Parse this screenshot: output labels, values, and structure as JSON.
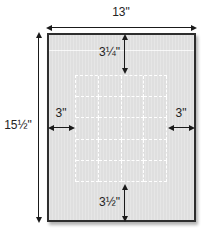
{
  "diagram": {
    "type": "measurement-diagram",
    "dimensions": {
      "panel_width": "13\"",
      "panel_height": "15½\"",
      "top_offset": "3¼\"",
      "left_offset": "3\"",
      "right_offset": "3\"",
      "bottom_offset": "3½\""
    },
    "grid": {
      "columns": 4,
      "rows": 5
    },
    "colors": {
      "panel_fill": "#e3e3e3",
      "panel_border": "#2e2e2e",
      "grid_line": "#ffffff",
      "dim_color": "#1a1a1a",
      "bg": "#ffffff",
      "shadow": "#b3b3b3"
    }
  }
}
